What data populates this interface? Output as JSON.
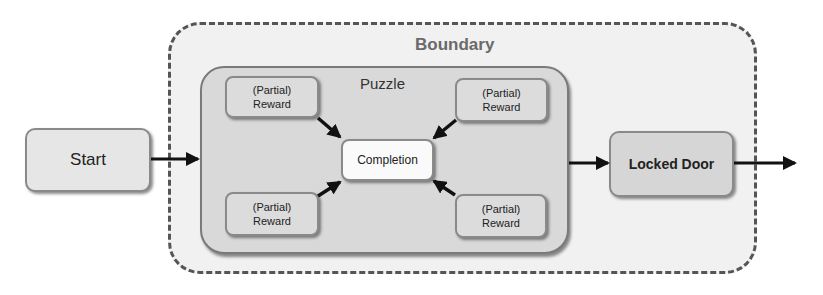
{
  "diagram": {
    "boundary": {
      "label": "Boundary"
    },
    "puzzle": {
      "label": "Puzzle",
      "rewards": [
        {
          "line1": "(Partial)",
          "line2": "Reward",
          "position": "top-left"
        },
        {
          "line1": "(Partial)",
          "line2": "Reward",
          "position": "top-right"
        },
        {
          "line1": "(Partial)",
          "line2": "Reward",
          "position": "bottom-left"
        },
        {
          "line1": "(Partial)",
          "line2": "Reward",
          "position": "bottom-right"
        }
      ],
      "completion": "Completion"
    },
    "start": "Start",
    "locked_door": "Locked Door",
    "edges": [
      {
        "from": "Start",
        "to": "Puzzle"
      },
      {
        "from": "(Partial) Reward",
        "to": "Completion"
      },
      {
        "from": "(Partial) Reward",
        "to": "Completion"
      },
      {
        "from": "(Partial) Reward",
        "to": "Completion"
      },
      {
        "from": "(Partial) Reward",
        "to": "Completion"
      },
      {
        "from": "Puzzle",
        "to": "Locked Door"
      },
      {
        "from": "Locked Door",
        "to": "exit"
      }
    ]
  }
}
